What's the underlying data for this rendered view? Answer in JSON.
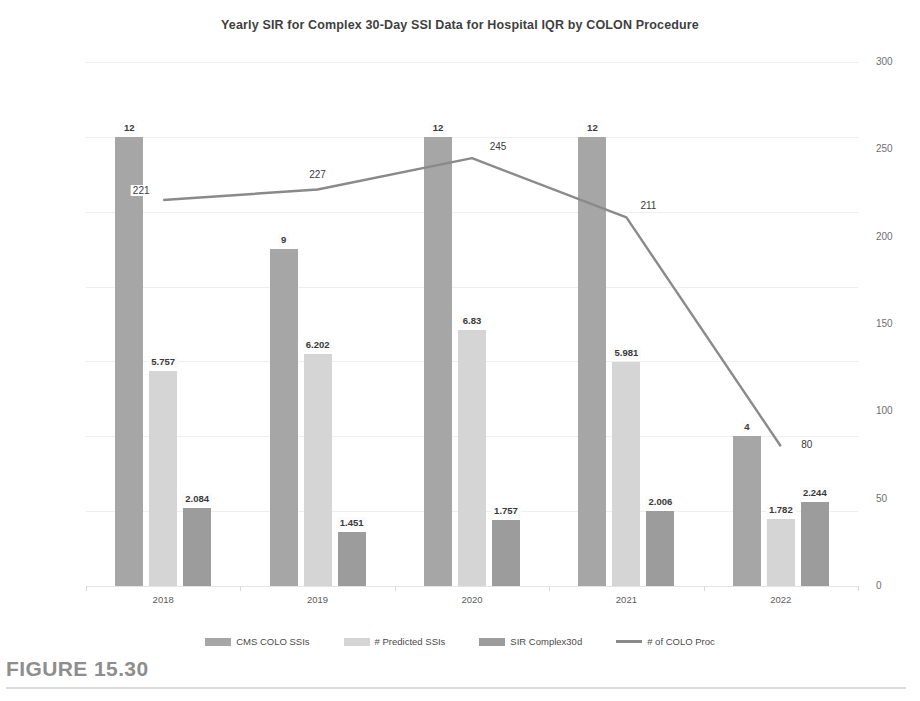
{
  "figure": {
    "caption": "FIGURE 15.30"
  },
  "chart_data": {
    "type": "bar",
    "title": "Yearly SIR for Complex 30-Day SSI Data for Hospital IQR by COLON Procedure",
    "xlabel": "",
    "ylabel": "",
    "categories": [
      "2018",
      "2019",
      "2020",
      "2021",
      "2022"
    ],
    "ylim": [
      0,
      14
    ],
    "yticks": [
      "0",
      "2",
      "4",
      "6",
      "8",
      "10",
      "12",
      "14"
    ],
    "y2lim": [
      0,
      300
    ],
    "y2ticks": [
      "0",
      "50",
      "100",
      "150",
      "200",
      "250",
      "300"
    ],
    "grid": true,
    "legend_position": "bottom",
    "series": [
      {
        "name": "CMS COLO SSIs",
        "type": "bar",
        "axis": "left",
        "color": "#a6a6a6",
        "values": [
          12,
          9,
          12,
          12,
          4
        ],
        "labels": [
          "12",
          "9",
          "12",
          "12",
          "4"
        ]
      },
      {
        "name": "# Predicted SSIs",
        "type": "bar",
        "axis": "left",
        "color": "#d5d5d5",
        "values": [
          5.757,
          6.202,
          6.83,
          5.981,
          1.782
        ],
        "labels": [
          "5.757",
          "6.202",
          "6.83",
          "5.981",
          "1.782"
        ]
      },
      {
        "name": "SIR Complex30d",
        "type": "bar",
        "axis": "left",
        "color": "#9c9c9c",
        "values": [
          2.084,
          1.451,
          1.757,
          2.006,
          2.244
        ],
        "labels": [
          "2.084",
          "1.451",
          "1.757",
          "2.006",
          "2.244"
        ]
      },
      {
        "name": "# of COLO Proc",
        "type": "line",
        "axis": "right",
        "color": "#8a8a8a",
        "values": [
          221,
          227,
          245,
          211,
          80
        ],
        "labels": [
          "221",
          "227",
          "245",
          "211",
          "80"
        ]
      }
    ]
  }
}
